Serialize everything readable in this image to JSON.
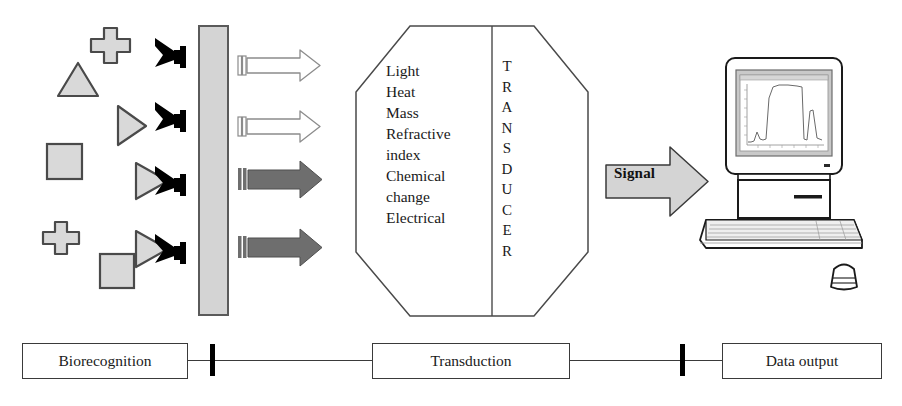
{
  "figure": {
    "type": "diagram"
  },
  "colors": {
    "analyte_fill": "#d9d9d9",
    "analyte_stroke": "#4a4a4a",
    "membrane_fill": "#d4d4d4",
    "membrane_stroke": "#5a5a5a",
    "antibody": "#000000",
    "arrow_light_fill": "#ffffff",
    "arrow_light_stroke": "#8c8c8c",
    "arrow_dark_fill": "#6e6e6e",
    "arrow_dark_stroke": "#4f4f4f",
    "signal_fill": "#d4d4d4",
    "signal_stroke": "#3a3a3a",
    "outline": "#3a3a3a",
    "text": "#1a1a1a",
    "background": "#ffffff"
  },
  "analytes": [
    {
      "name": "cross",
      "shape": "cross",
      "x": 95,
      "y": 28,
      "size": 32
    },
    {
      "name": "triangle-up",
      "shape": "triangle-up",
      "x": 62,
      "y": 62,
      "size": 36
    },
    {
      "name": "triangle-right",
      "shape": "triangle-right",
      "x": 118,
      "y": 106,
      "size": 32
    },
    {
      "name": "square-upper",
      "shape": "square",
      "x": 46,
      "y": 143,
      "size": 34
    },
    {
      "name": "cross-lower",
      "shape": "cross",
      "x": 48,
      "y": 222,
      "size": 30
    },
    {
      "name": "square-lower",
      "shape": "square",
      "x": 100,
      "y": 253,
      "size": 34
    }
  ],
  "membrane": {
    "label": "sensing membrane",
    "x": 199,
    "y": 26,
    "width": 29,
    "height": 289
  },
  "receptors": [
    {
      "name": "antibody-1",
      "y": 48,
      "bound": false
    },
    {
      "name": "antibody-2",
      "y": 112,
      "bound": false
    },
    {
      "name": "antibody-3",
      "y": 176,
      "bound": true
    },
    {
      "name": "antibody-4",
      "y": 243,
      "bound": true
    }
  ],
  "transduction_arrows": [
    {
      "name": "arrow-light-1",
      "y": 56,
      "style": "light"
    },
    {
      "name": "arrow-light-2",
      "y": 116,
      "style": "light"
    },
    {
      "name": "arrow-dark-1",
      "y": 178,
      "style": "dark"
    },
    {
      "name": "arrow-dark-2",
      "y": 246,
      "style": "dark"
    }
  ],
  "transducer": {
    "vertical_label": "TRANSDUCER",
    "vertical_letters": [
      "T",
      "R",
      "A",
      "N",
      "S",
      "D",
      "U",
      "C",
      "E",
      "R"
    ],
    "properties": [
      "Light",
      "Heat",
      "Mass",
      "Refractive",
      "index",
      "Chemical",
      "change",
      "Electrical"
    ],
    "property_lines": "Light\nHeat\nMass\nRefractive\nindex\nChemical\nchange\nElectrical"
  },
  "signal": {
    "label": "Signal"
  },
  "computer": {
    "name": "data-output-computer",
    "screen_chart": {
      "type": "line",
      "description": "sensorgram trace on monitor",
      "x": [
        0,
        4,
        9,
        13,
        16,
        19,
        22,
        26,
        30,
        38,
        50,
        62,
        70,
        74,
        78,
        82,
        86,
        92,
        100
      ],
      "y": [
        6,
        6,
        7,
        16,
        10,
        9,
        10,
        62,
        78,
        80,
        80,
        79,
        78,
        10,
        9,
        40,
        42,
        12,
        9
      ],
      "xlabel": "",
      "ylabel": "",
      "grid": false
    }
  },
  "flow": {
    "steps": [
      {
        "name": "biorecognition",
        "label": "Biorecognition",
        "x": 22,
        "width": 164
      },
      {
        "name": "transduction",
        "label": "Transduction",
        "x": 372,
        "width": 196
      },
      {
        "name": "data-output",
        "label": "Data output",
        "x": 722,
        "width": 158
      }
    ],
    "ticks": [
      {
        "name": "tick-1",
        "x": 212
      },
      {
        "name": "tick-2",
        "x": 682
      }
    ]
  }
}
